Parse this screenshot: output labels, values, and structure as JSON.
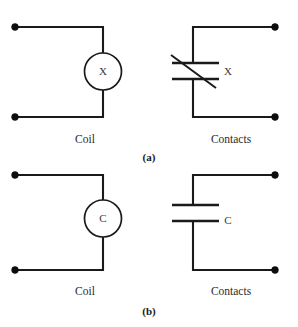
{
  "figure": {
    "background_color": "#ffffff",
    "line_color": "#1a1a1a",
    "text_color": "#2b2b2b",
    "title": "",
    "panels": [
      {
        "id": "a",
        "figure_label": "(a)",
        "coil": {
          "symbol_text": "X",
          "caption": "Coil",
          "shape": "circle"
        },
        "contacts": {
          "symbol_text": "X",
          "caption": "Contacts",
          "type": "normally-closed",
          "has_slash": true
        }
      },
      {
        "id": "b",
        "figure_label": "(b)",
        "coil": {
          "symbol_text": "C",
          "caption": "Coil",
          "shape": "circle"
        },
        "contacts": {
          "symbol_text": "C",
          "caption": "Contacts",
          "type": "normally-open",
          "has_slash": false
        }
      }
    ]
  }
}
